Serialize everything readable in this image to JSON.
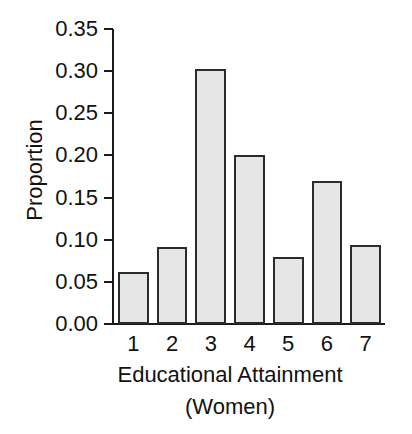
{
  "chart_data": {
    "type": "bar",
    "title": "",
    "subtitle": "",
    "xlabel": "Educational Attainment",
    "xlabel_line2": "(Women)",
    "ylabel": "Proportion",
    "categories": [
      "1",
      "2",
      "3",
      "4",
      "5",
      "6",
      "7"
    ],
    "values": [
      0.062,
      0.091,
      0.303,
      0.201,
      0.08,
      0.17,
      0.094
    ],
    "series": [
      {
        "name": "Proportion",
        "values": [
          0.062,
          0.091,
          0.303,
          0.201,
          0.08,
          0.17,
          0.094
        ]
      }
    ],
    "ylim": [
      0.0,
      0.35
    ],
    "xlim": [
      0.5,
      7.5
    ],
    "ytick_values": [
      0.0,
      0.05,
      0.1,
      0.15,
      0.2,
      0.25,
      0.3,
      0.35
    ],
    "ytick_labels": [
      "0.00",
      "0.05",
      "0.10",
      "0.15",
      "0.20",
      "0.25",
      "0.30",
      "0.35"
    ],
    "xtick_labels": [
      "1",
      "2",
      "3",
      "4",
      "5",
      "6",
      "7"
    ],
    "grid": false,
    "legend": false,
    "legend_position": "none",
    "bar_fill_color": "#e6e6e6",
    "bar_edge_color": "#2b2b2b",
    "axis_color": "#1a1a1a",
    "background_color": "#ffffff",
    "annotations": []
  }
}
